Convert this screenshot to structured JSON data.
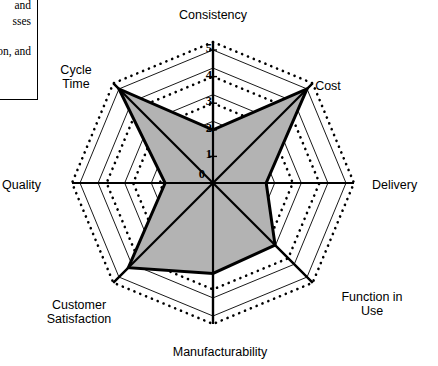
{
  "sidebar_note": {
    "name": "clipped-text-box",
    "lines": [
      "and",
      "sses"
    ],
    "line3": "on, and"
  },
  "chart_data": {
    "type": "radar",
    "title": "",
    "categories": [
      "Consistency",
      "Cost",
      "Delivery",
      "Function in Use",
      "Manufacturability",
      "Customer Satisfaction",
      "Quality",
      "Cycle Time"
    ],
    "category_lines": [
      [
        "Consistency"
      ],
      [
        "Cost"
      ],
      [
        "Delivery"
      ],
      [
        "Function in",
        "Use"
      ],
      [
        "Manufacturability"
      ],
      [
        "Customer",
        "Satisfaction"
      ],
      [
        "Quality"
      ],
      [
        "Cycle",
        "Time"
      ]
    ],
    "series": [
      {
        "name": "Assessment",
        "values": [
          2.0,
          5.0,
          2.0,
          3.3,
          3.4,
          4.5,
          1.8,
          5.0
        ],
        "line_color": "#000000",
        "fill_color": "#b3b3b3",
        "line_width": 3
      }
    ],
    "rlim": [
      0,
      5
    ],
    "tick_values": [
      0,
      1,
      2,
      3,
      4,
      5
    ],
    "tick_labels": [
      "0",
      "1",
      "2",
      "3",
      "4",
      "5"
    ],
    "tick_axis": "vertical-top",
    "grid": "polygon",
    "grid_style": "alternating-solid-and-dotted",
    "grid_color": "#000000",
    "legend": "none",
    "axis_line_color": "#000000"
  },
  "geometry": {
    "center_x": 213,
    "center_y": 183,
    "radius_max": 133,
    "axis_count": 8,
    "start_angle_deg": 90
  }
}
